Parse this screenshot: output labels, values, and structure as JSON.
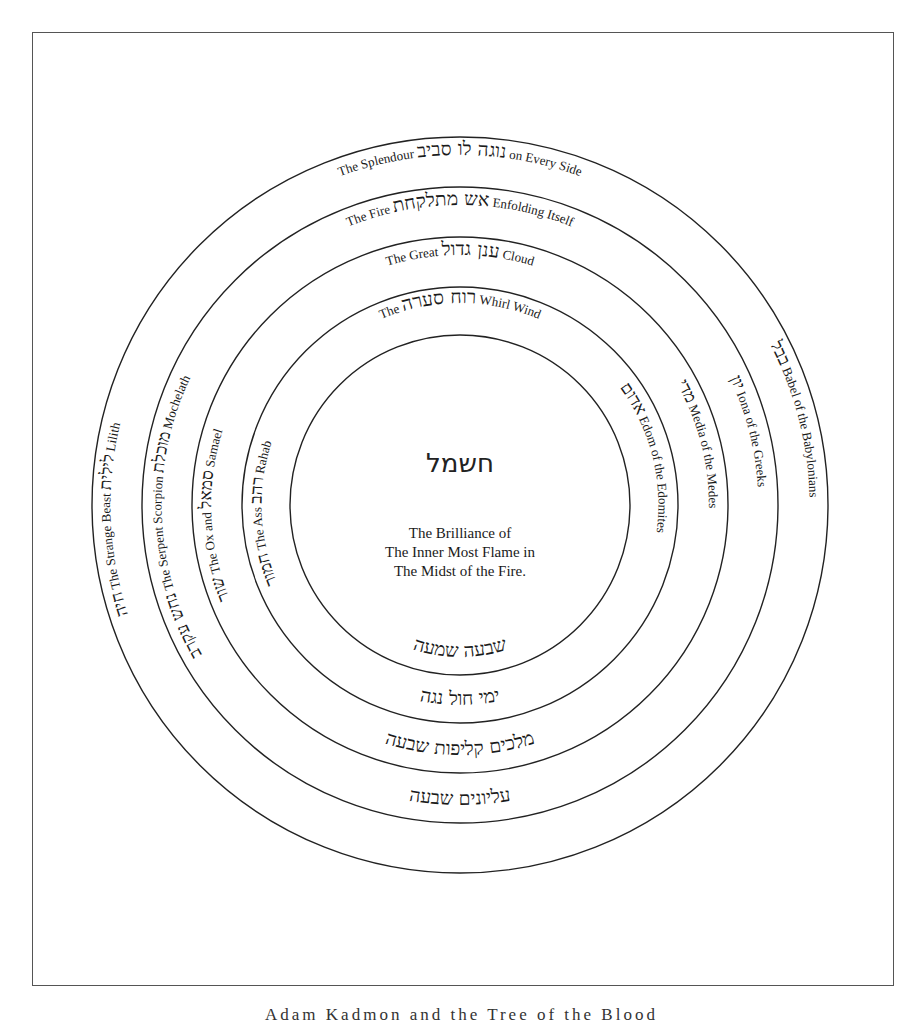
{
  "diagram": {
    "center": {
      "cx": 460,
      "cy": 505
    },
    "stroke_color": "#222222",
    "rings": [
      {
        "r": 368
      },
      {
        "r": 318
      },
      {
        "r": 268
      },
      {
        "r": 218
      },
      {
        "r": 170
      }
    ],
    "core": {
      "hebrew": "חשמל",
      "lines": [
        "The Brilliance of",
        "The Inner Most Flame in",
        "The Midst of the Fire."
      ]
    },
    "top_shells": [
      {
        "en_before": "The Splendour",
        "hebrew": "נוגה לו סביב",
        "en_after": "on Every Side"
      },
      {
        "en_before": "The Fire",
        "hebrew": "אש מתלקחת",
        "en_after": "Enfolding Itself"
      },
      {
        "en_before": "The Great",
        "hebrew": "ענן גדול",
        "en_after": "Cloud"
      },
      {
        "en_before": "The",
        "hebrew": "רוח סערה",
        "en_after": "Whirl Wind"
      }
    ],
    "left_shells": [
      {
        "hebrew": "לילית",
        "en": "Lilith",
        "hebrew2": "חיה",
        "en2": "The Strange Beast"
      },
      {
        "hebrew": "מוכלת",
        "en": "Mochelath",
        "hebrew2": "נחש עקרב",
        "en2": "The Serpent Scorpion"
      },
      {
        "hebrew": "סמאל",
        "en": "Samael",
        "hebrew2": "שור",
        "en2": "The Ox and"
      },
      {
        "hebrew": "רהב",
        "en": "Rahab",
        "hebrew2": "חמור",
        "en2": "The Ass"
      }
    ],
    "right_shells": [
      {
        "hebrew": "בבל",
        "en": "Babel of the Babylonians"
      },
      {
        "hebrew": "יון",
        "en": "Iona of the Greeks"
      },
      {
        "hebrew": "מדי",
        "en": "Media of the Medes"
      },
      {
        "hebrew": "אדום",
        "en": "Edom of the Edomites"
      }
    ],
    "bottom_shells": [
      {
        "hebrew": "שבעה שמעה"
      },
      {
        "hebrew": "ימי חול נגה"
      },
      {
        "hebrew": "מלכים קליפות שבעה"
      },
      {
        "hebrew": "עליונים שבעה"
      }
    ],
    "caption": "Adam Kadmon and the Tree of the Blood"
  }
}
